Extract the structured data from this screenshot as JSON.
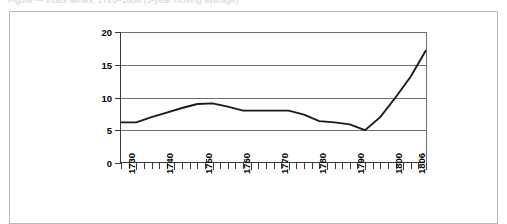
{
  "caption": {
    "text": "Figure — index series, 1726–1806 (5-year moving average)"
  },
  "chart_data": {
    "type": "line",
    "title": "",
    "subtitle": "",
    "xlabel": "",
    "ylabel": "",
    "xlim": [
      1726,
      1806
    ],
    "ylim": [
      0,
      20
    ],
    "grid": true,
    "legend": false,
    "legend_position": "none",
    "y_ticks": [
      0,
      5,
      10,
      15,
      20
    ],
    "y_tick_labels": [
      "0",
      "5",
      "10",
      "15",
      "20"
    ],
    "x_tick_labels": [
      "1730",
      "1740",
      "1750",
      "1760",
      "1770",
      "1780",
      "1790",
      "1800",
      "1806"
    ],
    "x_tick_values": [
      1730,
      1740,
      1750,
      1760,
      1770,
      1780,
      1790,
      1800,
      1806
    ],
    "x_minor_step": 2,
    "series": [
      {
        "name": "series-1",
        "color": "#1a1a1a",
        "x": [
          1726,
          1730,
          1734,
          1738,
          1742,
          1746,
          1750,
          1754,
          1758,
          1762,
          1766,
          1770,
          1774,
          1778,
          1782,
          1786,
          1790,
          1794,
          1798,
          1802,
          1806
        ],
        "values": [
          6.2,
          6.2,
          7.0,
          7.7,
          8.4,
          9.0,
          9.1,
          8.6,
          8.0,
          8.0,
          8.0,
          8.0,
          7.4,
          6.4,
          6.2,
          5.9,
          5.0,
          7.0,
          10.0,
          13.2,
          17.2
        ]
      }
    ]
  },
  "axes": {
    "y_axis_name": "value-axis",
    "x_axis_name": "year-axis"
  }
}
